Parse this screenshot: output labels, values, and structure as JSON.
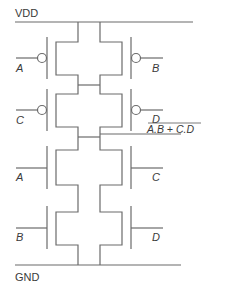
{
  "diagram": {
    "type": "CMOS AOI22 gate schematic",
    "rails": {
      "supply_label": "VDD",
      "ground_label": "GND"
    },
    "pull_up": [
      {
        "left_input": "A",
        "right_input": "B",
        "kind": "PMOS"
      },
      {
        "left_input": "C",
        "right_input": "D",
        "kind": "PMOS"
      }
    ],
    "pull_down": [
      {
        "left_input": "A",
        "right_input": "C",
        "kind": "NMOS"
      },
      {
        "left_input": "B",
        "right_input": "D",
        "kind": "NMOS"
      }
    ],
    "output": {
      "label": "A.B + C.D",
      "inverted": true
    },
    "colors": {
      "wire": "#6b6b6b",
      "text": "#3a3a3a",
      "background": "#ffffff"
    }
  }
}
